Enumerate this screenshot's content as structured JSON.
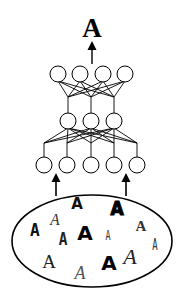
{
  "diagram": {
    "type": "neural-network-classifier",
    "output": {
      "label": "A",
      "x": 92,
      "y": 37,
      "size": 27
    },
    "network": {
      "stroke": "#000000",
      "node_radius": 8,
      "layers": [
        {
          "name": "output-layer",
          "y": 74,
          "nodes_x": [
            58,
            80,
            103,
            125
          ]
        },
        {
          "name": "hidden-layer",
          "y": 121,
          "nodes_x": [
            68,
            91,
            114
          ]
        },
        {
          "name": "input-layer",
          "y": 165,
          "nodes_x": [
            44,
            67,
            91,
            114,
            137
          ]
        }
      ],
      "junction_offsets": {
        "hidden": 97,
        "input": 143
      }
    },
    "input_arrows_x": [
      56,
      126
    ],
    "input_set": {
      "ellipse": {
        "cx": 92,
        "cy": 241,
        "rx": 80,
        "ry": 46
      },
      "letters": [
        {
          "label": "A",
          "style": "script",
          "x": 55,
          "y": 225,
          "size": 17,
          "color": "#333333"
        },
        {
          "label": "A",
          "style": "bold-sans",
          "x": 77,
          "y": 209,
          "size": 15,
          "color": "#111111"
        },
        {
          "label": "A",
          "style": "heavy-black",
          "x": 117,
          "y": 215,
          "size": 20,
          "color": "#000000"
        },
        {
          "label": "A",
          "style": "blackletter",
          "x": 141,
          "y": 231,
          "size": 15,
          "color": "#333333"
        },
        {
          "label": "A",
          "style": "rounded-bold",
          "x": 35,
          "y": 236,
          "size": 18,
          "color": "#111111"
        },
        {
          "label": "A",
          "style": "curly",
          "x": 63,
          "y": 245,
          "size": 17,
          "color": "#222222"
        },
        {
          "label": "A",
          "style": "bold-sans",
          "x": 85,
          "y": 240,
          "size": 20,
          "color": "#000000"
        },
        {
          "label": "A",
          "style": "thin-condensed",
          "x": 108,
          "y": 240,
          "size": 14,
          "color": "#333333"
        },
        {
          "label": "A",
          "style": "serif",
          "x": 49,
          "y": 268,
          "size": 19,
          "color": "#222222"
        },
        {
          "label": "A",
          "style": "script-outline",
          "x": 80,
          "y": 279,
          "size": 18,
          "color": "#555555"
        },
        {
          "label": "A",
          "style": "bold-sans",
          "x": 109,
          "y": 270,
          "size": 20,
          "color": "#000000"
        },
        {
          "label": "A",
          "style": "swash-script",
          "x": 130,
          "y": 264,
          "size": 21,
          "color": "#222222"
        },
        {
          "label": "A",
          "style": "thin-condensed",
          "x": 155,
          "y": 250,
          "size": 15,
          "color": "#333333"
        }
      ]
    }
  }
}
